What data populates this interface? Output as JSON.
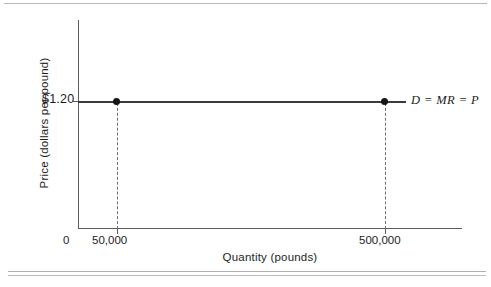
{
  "figure": {
    "background_color": "#ffffff",
    "line_color": "#3b3b3f",
    "axis_color": "#5b5b5f",
    "marker_color": "#161616",
    "rule_color": "#b8b8bc"
  },
  "chart_data": {
    "type": "line",
    "title": "",
    "xlabel": "Quantity (pounds)",
    "ylabel": "Price (dollars per pound)",
    "grid": false,
    "legend_position": "inline-right",
    "x_tick_labels": [
      "0",
      "50,000",
      "500,000"
    ],
    "x_tick_values": [
      0,
      50000,
      500000
    ],
    "y_tick_labels": [
      "$1.20"
    ],
    "y_tick_values": [
      1.2
    ],
    "xlim": [
      0,
      560000
    ],
    "ylim": [
      0,
      1.75
    ],
    "series": [
      {
        "name": "D = MR = P",
        "x": [
          0,
          50000,
          500000
        ],
        "values": [
          1.2,
          1.2,
          1.2
        ],
        "style": "solid-horizontal",
        "marked_points": [
          {
            "x": 50000,
            "y": 1.2,
            "x_label": "50,000"
          },
          {
            "x": 500000,
            "y": 1.2,
            "x_label": "500,000"
          }
        ]
      }
    ],
    "annotations": [
      {
        "text": "D = MR = P",
        "style": "italic",
        "attached_to": "demand-line-right-end"
      }
    ],
    "drop_lines": [
      {
        "from_x": 50000,
        "to_y": 0,
        "style": "dashed"
      },
      {
        "from_x": 500000,
        "to_y": 0,
        "style": "dashed"
      }
    ]
  },
  "axes": {
    "y_title": "Price (dollars per pound)",
    "x_title": "Quantity (pounds)",
    "price_tick_label": "$1.20",
    "origin_label": "0",
    "quantity_low_label": "50,000",
    "quantity_high_label": "500,000"
  },
  "annotation": {
    "demand_curve_label": "D = MR = P"
  }
}
